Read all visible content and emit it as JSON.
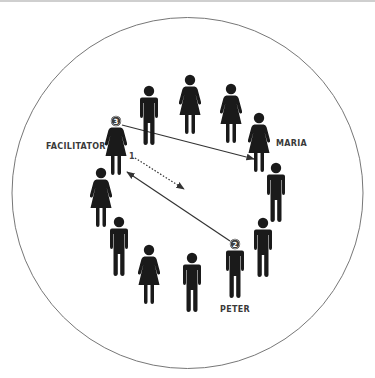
{
  "diagram": {
    "colors": {
      "figure": "#1a1a1a",
      "circle_stroke": "#777777",
      "arrow": "#333333",
      "label": "#3a3a3a",
      "badge_fill": "#3c3c3c"
    },
    "labels": {
      "facilitator": "FACILITATOR",
      "maria": "MARIA",
      "peter": "PETER"
    },
    "step_numbers": {
      "step1": "1",
      "step2": "2",
      "step3": "3"
    },
    "figures": [
      {
        "id": "man-top-left",
        "type": "man"
      },
      {
        "id": "woman-top",
        "type": "woman"
      },
      {
        "id": "woman-top-right",
        "type": "woman"
      },
      {
        "id": "maria",
        "type": "woman",
        "label": "MARIA"
      },
      {
        "id": "man-right",
        "type": "man"
      },
      {
        "id": "man-right-lower",
        "type": "man"
      },
      {
        "id": "peter",
        "type": "man",
        "label": "PETER",
        "badge": "2"
      },
      {
        "id": "man-bottom",
        "type": "man"
      },
      {
        "id": "woman-bottom",
        "type": "woman"
      },
      {
        "id": "man-left-lower",
        "type": "man"
      },
      {
        "id": "woman-left",
        "type": "woman"
      },
      {
        "id": "facilitator",
        "type": "woman",
        "label": "FACILITATOR",
        "badge": "3"
      }
    ],
    "arrows": [
      {
        "id": "arrow-facilitator-to-maria",
        "style": "solid",
        "direction": "one-way"
      },
      {
        "id": "arrow-step1-dotted",
        "style": "dotted",
        "direction": "one-way"
      },
      {
        "id": "arrow-facilitator-peter",
        "style": "solid",
        "direction": "two-way"
      }
    ]
  }
}
